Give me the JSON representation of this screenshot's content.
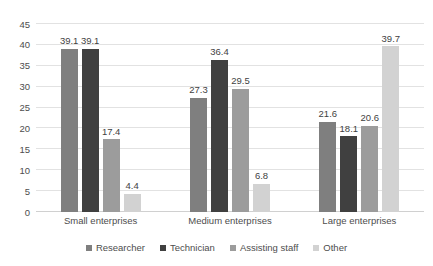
{
  "chart_data": {
    "type": "bar",
    "title": "",
    "subtitle": "",
    "xlabel": "",
    "ylabel": "",
    "ylim": [
      0,
      45
    ],
    "yticks": [
      0,
      5,
      10,
      15,
      20,
      25,
      30,
      35,
      40,
      45
    ],
    "ytick_labels": [
      "0",
      "5",
      "10",
      "15",
      "20",
      "25",
      "30",
      "35",
      "40",
      "45"
    ],
    "grid": true,
    "grid_axis": "y",
    "legend_position": "bottom",
    "show_data_labels": true,
    "categories": [
      "Small enterprises",
      "Medium enterprises",
      "Large enterprises"
    ],
    "series": [
      {
        "name": "Researcher",
        "color": "#7f7f7f",
        "values": [
          39.1,
          27.3,
          21.6
        ],
        "labels": [
          "39.1",
          "27.3",
          "21.6"
        ]
      },
      {
        "name": "Technician",
        "color": "#404040",
        "values": [
          39.1,
          36.4,
          18.1
        ],
        "labels": [
          "39.1",
          "36.4",
          "18.1"
        ]
      },
      {
        "name": "Assisting staff",
        "color": "#9c9c9c",
        "values": [
          17.4,
          29.5,
          20.6
        ],
        "labels": [
          "17.4",
          "29.5",
          "20.6"
        ]
      },
      {
        "name": "Other",
        "color": "#d2d2d2",
        "values": [
          4.4,
          6.8,
          39.7
        ],
        "labels": [
          "4.4",
          "6.8",
          "39.7"
        ]
      }
    ],
    "colors": {
      "grid": "#e2e2e2",
      "axis": "#d0d0d0",
      "text": "#4d4d4d",
      "label_text": "#3f3f3f",
      "background": "#ffffff"
    }
  }
}
